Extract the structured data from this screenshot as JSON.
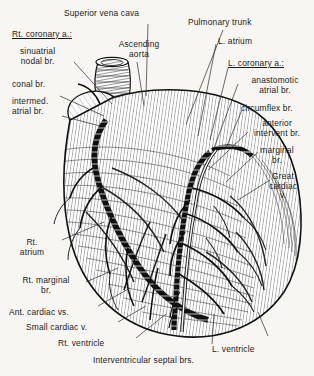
{
  "figure": {
    "background_color": "#f7f6f3",
    "ink_color": "#1b1b1b",
    "credit_text": "— · · —"
  },
  "labels": {
    "superior_vena_cava": "Superior vena cava",
    "rt_coronary_heading": "Rt. coronary a.:",
    "sinuatrial_nodal_br": "sinuatrial\nnodal br.",
    "conal_br": "conal br.",
    "intermed_atrial_br": "intermed.\natrial br.",
    "ascending_aorta": "Ascending\naorta",
    "pulmonary_trunk": "Pulmonary trunk",
    "l_atrium": "L. atrium",
    "l_coronary_heading": "L. coronary a.:",
    "anastomotic_atrial_br": "anastomotic\natrial br.",
    "circumflex_br": "circumflex br.",
    "anterior_intervent_br": "anterior\nintervent br.",
    "marginal_br": "marginal\nbr.",
    "great_cardiac_v": "Great\ncardiac\nv.",
    "rt_atrium": "Rt.\natrium",
    "rt_marginal_br": "Rt. marginal\nbr.",
    "ant_cardiac_vs": "Ant. cardiac vs.",
    "small_cardiac_v": "Small cardiac v.",
    "rt_ventricle": "Rt. ventricle",
    "interventricular_septal_brs": "Interventricular septal brs.",
    "l_ventricle": "L. ventricle"
  }
}
